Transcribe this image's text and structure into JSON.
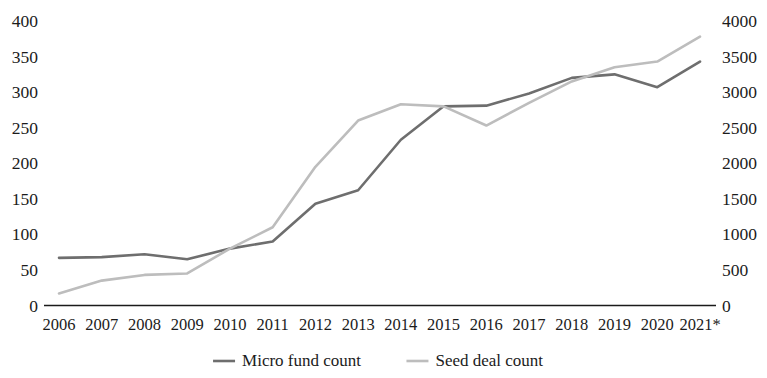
{
  "chart_data": {
    "type": "line",
    "title": "",
    "subtitle": "",
    "xlabel": "",
    "ylabel": "",
    "grid": false,
    "legend_position": "bottom-center",
    "categories": [
      "2006",
      "2007",
      "2008",
      "2009",
      "2010",
      "2011",
      "2012",
      "2013",
      "2014",
      "2015",
      "2016",
      "2017",
      "2018",
      "2019",
      "2020",
      "2021*"
    ],
    "axes": {
      "left": {
        "label": "",
        "ylim": [
          0,
          400
        ],
        "tick_step": 50,
        "ticks": [
          "0",
          "50",
          "100",
          "150",
          "200",
          "250",
          "300",
          "350",
          "400"
        ],
        "tick_values": [
          0,
          50,
          100,
          150,
          200,
          250,
          300,
          350,
          400
        ]
      },
      "right": {
        "label": "",
        "ylim": [
          0,
          4000
        ],
        "tick_step": 500,
        "ticks": [
          "0",
          "500",
          "1000",
          "1500",
          "2000",
          "2500",
          "3000",
          "3500",
          "4000"
        ],
        "tick_values": [
          0,
          500,
          1000,
          1500,
          2000,
          2500,
          3000,
          3500,
          4000
        ]
      },
      "x": {
        "ticks": [
          "2006",
          "2007",
          "2008",
          "2009",
          "2010",
          "2011",
          "2012",
          "2013",
          "2014",
          "2015",
          "2016",
          "2017",
          "2018",
          "2019",
          "2020",
          "2021*"
        ]
      }
    },
    "series": [
      {
        "name": "Micro fund count",
        "axis": "left",
        "color": "#6e6e6e",
        "values": [
          67,
          68,
          72,
          65,
          80,
          90,
          143,
          162,
          233,
          280,
          281,
          298,
          320,
          325,
          307,
          343
        ]
      },
      {
        "name": "Seed deal count",
        "axis": "right",
        "color": "#bdbdbd",
        "values": [
          170,
          350,
          430,
          450,
          800,
          1100,
          1950,
          2600,
          2830,
          2800,
          2530,
          2850,
          3150,
          3350,
          3430,
          3780
        ]
      }
    ],
    "legend": [
      {
        "label": "Micro fund count",
        "color": "#6e6e6e"
      },
      {
        "label": "Seed deal count",
        "color": "#bdbdbd"
      }
    ],
    "annotations": [
      {
        "text": "2021*",
        "note": "asterisk denotes partial or estimated year"
      }
    ],
    "colors": {
      "background": "#ffffff",
      "axis": "#1b1b1b",
      "text": "#1b1b1b",
      "series_micro_fund": "#6e6e6e",
      "series_seed_deal": "#bdbdbd"
    }
  }
}
